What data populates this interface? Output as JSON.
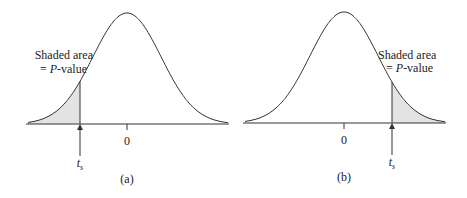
{
  "panels": [
    {
      "id": "a",
      "caption": "(a)",
      "tail": "left",
      "annotation_line1": "Shaded area",
      "annotation_line2_prefix": "= ",
      "annotation_line2_italic": "P",
      "annotation_line2_suffix": "-value",
      "center_tick_label": "0",
      "stat_label_main": "t",
      "stat_label_sub": "s"
    },
    {
      "id": "b",
      "caption": "(b)",
      "tail": "right",
      "annotation_line1": "Shaded area",
      "annotation_line2_prefix": "= ",
      "annotation_line2_italic": "P",
      "annotation_line2_suffix": "-value",
      "center_tick_label": "0",
      "stat_label_main": "t",
      "stat_label_sub": "s"
    }
  ],
  "colors": {
    "curve": "#333333",
    "shade": "#e3e3e3",
    "text": "#222222"
  }
}
